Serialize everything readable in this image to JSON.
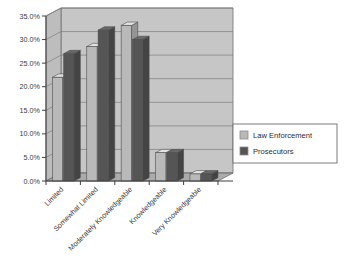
{
  "chart_data": {
    "type": "bar",
    "title": "",
    "subtitle": "",
    "xlabel": "",
    "ylabel": "",
    "categories": [
      "Limited",
      "Somewhat Limited",
      "Moderately Knowledgeable",
      "Knowledgeable",
      "Very Knowledgeable"
    ],
    "series": [
      {
        "name": "Law Enforcement",
        "color": "#b9b9b9",
        "values": [
          22.0,
          28.5,
          33.0,
          6.0,
          1.5
        ]
      },
      {
        "name": "Prosecutors",
        "color": "#555555",
        "values": [
          27.0,
          32.0,
          30.0,
          6.0,
          1.5
        ]
      }
    ],
    "ylim": [
      0,
      35
    ],
    "ytick_values": [
      0,
      5,
      10,
      15,
      20,
      25,
      30,
      35
    ],
    "ytick_labels": [
      "0.0%",
      "5.0%",
      "10.0%",
      "15.0%",
      "20.0%",
      "25.0%",
      "30.0%",
      "35.0%"
    ],
    "grid": true,
    "grid_axis": "y",
    "legend_position": "right",
    "style": "3d-column",
    "plot_background": "#c4c4c4",
    "floor_color": "#a8a8a8",
    "frame_color": "#6e6e6e",
    "gridline_color": "#7a7a7a",
    "axis_color": "#4a4a4a",
    "category_label_rotation": -45
  },
  "legend": {
    "items": [
      {
        "label": "Law Enforcement",
        "swatch": "#b9b9b9"
      },
      {
        "label": "Prosecutors",
        "swatch": "#555555"
      }
    ],
    "border_color": "#6e6e6e",
    "background": "#ffffff"
  }
}
